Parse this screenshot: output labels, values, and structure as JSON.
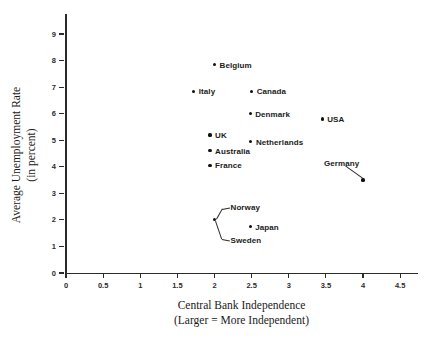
{
  "chart_data": {
    "type": "scatter",
    "title": "",
    "xlabel": "Central Bank Independence (Larger = More Independent)",
    "ylabel": "Average Unemployment Rate (in percent)",
    "xlim": [
      0,
      4.75
    ],
    "ylim": [
      0,
      9.8
    ],
    "grid": false,
    "legend": false,
    "x_ticks": [
      "0",
      "0.5",
      "1",
      "1.5",
      "2",
      "2.5",
      "3",
      "3.5",
      "4",
      "4.5"
    ],
    "x_tick_values": [
      0,
      0.5,
      1,
      1.5,
      2,
      2.5,
      3,
      3.5,
      4,
      4.5
    ],
    "y_ticks": [
      "0",
      "1",
      "2",
      "3",
      "4",
      "5",
      "6",
      "7",
      "8",
      "9"
    ],
    "y_tick_values": [
      0,
      1,
      2,
      3,
      4,
      5,
      6,
      7,
      8,
      9
    ],
    "points": [
      {
        "label": "Belgium",
        "x": 2.0,
        "y": 7.85,
        "label_pos": "right"
      },
      {
        "label": "Italy",
        "x": 1.72,
        "y": 6.85,
        "label_pos": "right"
      },
      {
        "label": "Canada",
        "x": 2.5,
        "y": 6.85,
        "label_pos": "right"
      },
      {
        "label": "Denmark",
        "x": 2.48,
        "y": 6.0,
        "label_pos": "right"
      },
      {
        "label": "USA",
        "x": 3.45,
        "y": 5.8,
        "label_pos": "right"
      },
      {
        "label": "UK",
        "x": 1.94,
        "y": 5.2,
        "label_pos": "right"
      },
      {
        "label": "Netherlands",
        "x": 2.49,
        "y": 4.95,
        "label_pos": "right"
      },
      {
        "label": "Australia",
        "x": 1.94,
        "y": 4.6,
        "label_pos": "right"
      },
      {
        "label": "France",
        "x": 1.94,
        "y": 4.05,
        "label_pos": "right"
      },
      {
        "label": "Germany",
        "x": 4.0,
        "y": 3.5,
        "label_pos": "leader-upleft"
      },
      {
        "label": "Norway",
        "x": 2.0,
        "y": 2.0,
        "label_pos": "leader-upright"
      },
      {
        "label": "Sweden",
        "x": 2.0,
        "y": 2.0,
        "label_pos": "leader-downright"
      },
      {
        "label": "Japan",
        "x": 2.48,
        "y": 1.75,
        "label_pos": "right"
      }
    ]
  },
  "axes": {
    "x_title_line1": "Central Bank Independence",
    "x_title_line2": "(Larger = More Independent)",
    "y_title_line1": "Average Unemployment Rate",
    "y_title_line2": "(in percent)"
  },
  "colors": {
    "point": "#111111",
    "axis": "#2b2b2b",
    "text": "#1a1a1a",
    "background": "#ffffff"
  }
}
